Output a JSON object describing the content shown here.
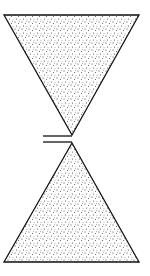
{
  "diagram": {
    "kind": "hourglass-schematic",
    "background": "#ffffff",
    "stroke_color": "#111111",
    "stipple_color": "#333333",
    "shapes": [
      {
        "name": "top-inverted-triangle",
        "points": [
          [
            4,
            15
          ],
          [
            139,
            15
          ],
          [
            72,
            135
          ]
        ],
        "fill": "stipple"
      },
      {
        "name": "bottom-triangle",
        "points": [
          [
            72,
            143
          ],
          [
            139,
            262
          ],
          [
            4,
            262
          ]
        ],
        "fill": "stipple"
      }
    ],
    "lines": [
      {
        "name": "upper-gap-line",
        "from": [
          43,
          136
        ],
        "to": [
          72,
          136
        ]
      },
      {
        "name": "lower-gap-line",
        "from": [
          43,
          142
        ],
        "to": [
          72,
          142
        ]
      }
    ],
    "labels": []
  }
}
